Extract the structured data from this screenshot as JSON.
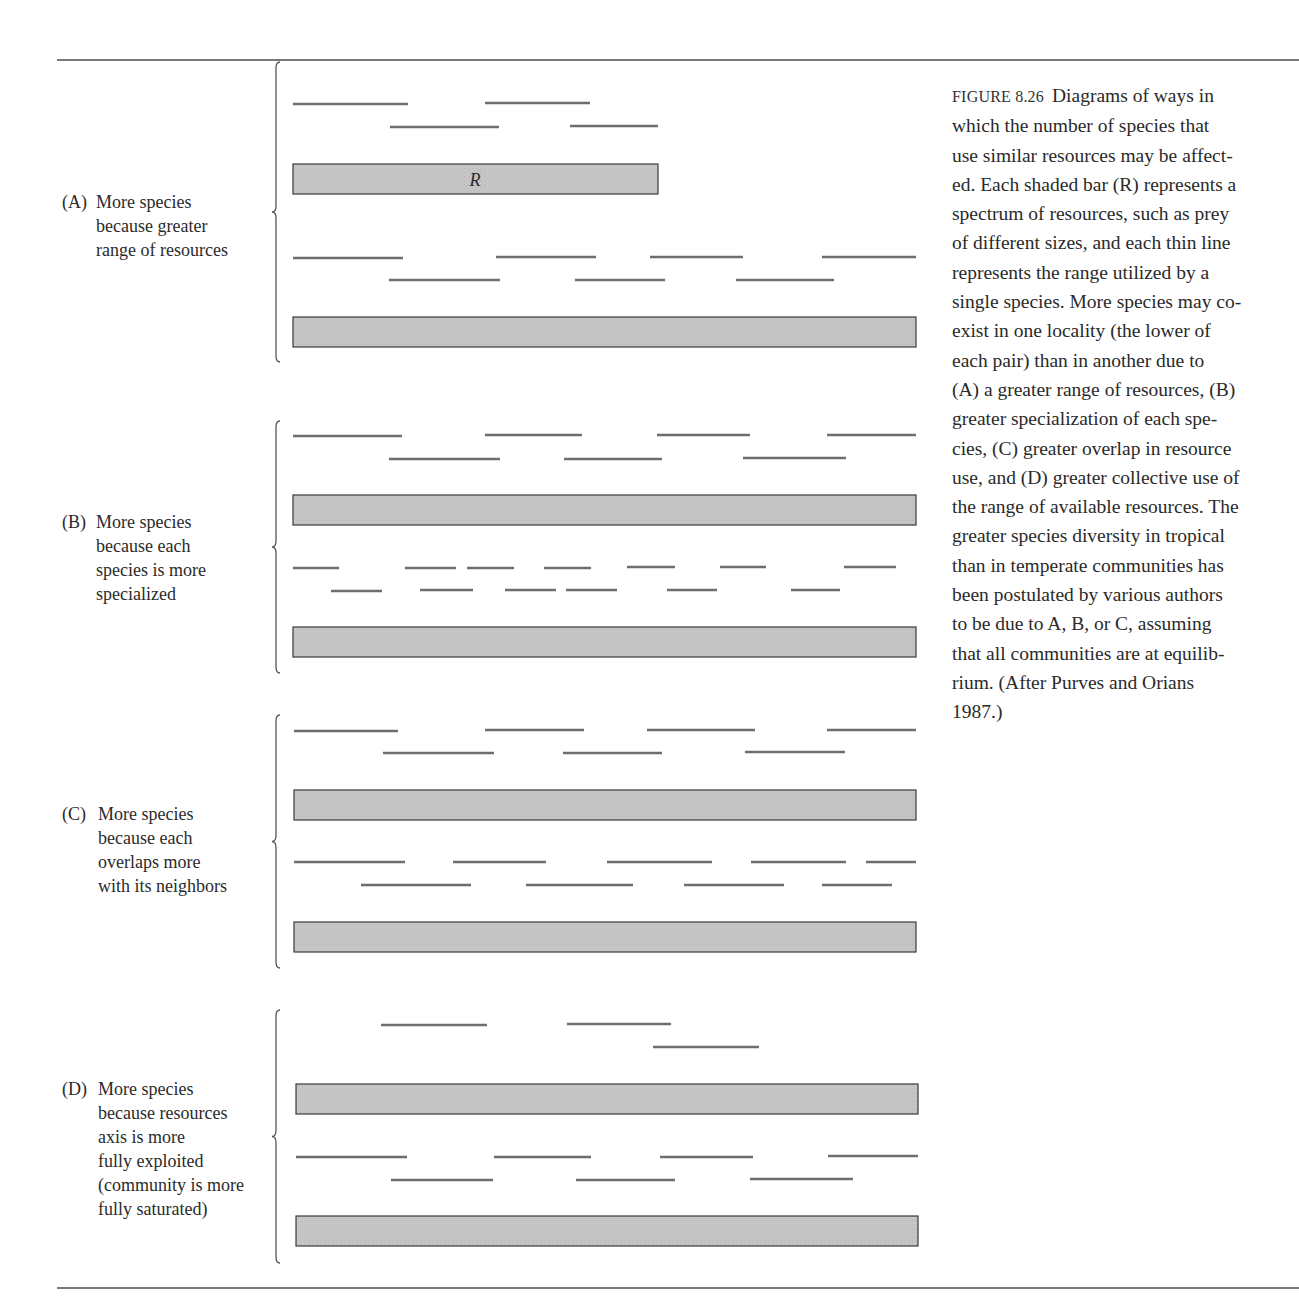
{
  "figure": {
    "number": "FIGURE 8.26",
    "caption_lines": [
      "Diagrams of ways in",
      "which the number of species that",
      "use similar resources may be affect-",
      "ed. Each shaded bar (R) represents a",
      "spectrum of resources, such as prey",
      "of different sizes, and each thin line",
      "represents the range utilized by a",
      "single species. More species may co-",
      "exist in one locality (the lower of",
      "each pair) than in another due to",
      "(A) a greater range of resources, (B)",
      "greater specialization of each spe-",
      "cies, (C) greater overlap in resource",
      "use, and (D) greater collective use of",
      "the range of available resources. The",
      "greater species diversity in tropical",
      "than in temperate communities has",
      "been postulated by various authors",
      "to be due to A, B, or C, assuming",
      "that all communities are at equilib-",
      "rium. (After Purves and Orians",
      "1987.)"
    ]
  },
  "colors": {
    "rule": "#7a7a7a",
    "segment": "#6e6e6e",
    "bar_fill": "#c4c4c4",
    "bar_stroke": "#3a3a3a",
    "text": "#2a2a2a"
  },
  "resource_bar_label": "R",
  "panels": [
    {
      "id": "A",
      "letter": "(A)",
      "label_lines": [
        "More species",
        "because greater",
        "range of resources"
      ],
      "label_top": 190,
      "brace": {
        "x": 276,
        "top": 62,
        "bottom": 362
      },
      "upper": {
        "segments": [
          [
            293,
            104,
            408
          ],
          [
            485,
            103,
            590
          ],
          [
            390,
            127,
            499
          ],
          [
            570,
            126,
            658
          ]
        ],
        "bar": {
          "x1": 293,
          "x2": 658,
          "y": 164,
          "h": 30
        }
      },
      "lower": {
        "segments": [
          [
            293,
            258,
            403
          ],
          [
            496,
            257,
            596
          ],
          [
            650,
            257,
            743
          ],
          [
            822,
            257,
            916
          ],
          [
            389,
            280,
            500
          ],
          [
            575,
            280,
            665
          ],
          [
            736,
            280,
            834
          ]
        ],
        "bar": {
          "x1": 293,
          "x2": 916,
          "y": 317,
          "h": 30
        }
      }
    },
    {
      "id": "B",
      "letter": "(B)",
      "label_lines": [
        "More species",
        "because each",
        "species is more",
        "specialized"
      ],
      "label_top": 510,
      "brace": {
        "x": 276,
        "top": 421,
        "bottom": 673
      },
      "upper": {
        "segments": [
          [
            293,
            436,
            402
          ],
          [
            485,
            435,
            582
          ],
          [
            657,
            435,
            750
          ],
          [
            827,
            435,
            916
          ],
          [
            389,
            459,
            500
          ],
          [
            564,
            459,
            662
          ],
          [
            743,
            458,
            846
          ]
        ],
        "bar": {
          "x1": 293,
          "x2": 916,
          "y": 495,
          "h": 30
        }
      },
      "lower": {
        "segments": [
          [
            293,
            568,
            339
          ],
          [
            405,
            568,
            456
          ],
          [
            467,
            568,
            514
          ],
          [
            544,
            568,
            591
          ],
          [
            627,
            567,
            675
          ],
          [
            720,
            567,
            766
          ],
          [
            844,
            567,
            896
          ],
          [
            331,
            591,
            382
          ],
          [
            420,
            590,
            473
          ],
          [
            505,
            590,
            556
          ],
          [
            566,
            590,
            617
          ],
          [
            667,
            590,
            717
          ],
          [
            791,
            590,
            840
          ]
        ],
        "bar": {
          "x1": 293,
          "x2": 916,
          "y": 627,
          "h": 30
        }
      }
    },
    {
      "id": "C",
      "letter": "(C)",
      "label_lines": [
        "More species",
        "because each",
        "overlaps more",
        "with its neighbors"
      ],
      "label_top": 802,
      "brace": {
        "x": 276,
        "top": 715,
        "bottom": 968
      },
      "upper": {
        "segments": [
          [
            294,
            731,
            398
          ],
          [
            485,
            730,
            584
          ],
          [
            647,
            730,
            755
          ],
          [
            827,
            730,
            916
          ],
          [
            383,
            753,
            494
          ],
          [
            563,
            753,
            662
          ],
          [
            745,
            752,
            845
          ]
        ],
        "bar": {
          "x1": 294,
          "x2": 916,
          "y": 790,
          "h": 30
        }
      },
      "lower": {
        "segments": [
          [
            294,
            862,
            405
          ],
          [
            453,
            862,
            546
          ],
          [
            607,
            862,
            712
          ],
          [
            751,
            862,
            846
          ],
          [
            866,
            862,
            916
          ],
          [
            361,
            885,
            471
          ],
          [
            526,
            885,
            633
          ],
          [
            684,
            885,
            784
          ],
          [
            822,
            885,
            892
          ]
        ],
        "bar": {
          "x1": 294,
          "x2": 916,
          "y": 922,
          "h": 30
        }
      }
    },
    {
      "id": "D",
      "letter": "(D)",
      "label_lines": [
        "More species",
        "because resources",
        "axis is more",
        "fully exploited",
        "(community is more",
        "fully saturated)"
      ],
      "label_top": 1077,
      "brace": {
        "x": 276,
        "top": 1010,
        "bottom": 1263
      },
      "upper": {
        "segments": [
          [
            381,
            1025,
            487
          ],
          [
            567,
            1024,
            671
          ],
          [
            653,
            1047,
            759
          ]
        ],
        "bar": {
          "x1": 296,
          "x2": 918,
          "y": 1084,
          "h": 30
        }
      },
      "lower": {
        "segments": [
          [
            296,
            1157,
            407
          ],
          [
            494,
            1157,
            591
          ],
          [
            660,
            1157,
            753
          ],
          [
            828,
            1156,
            918
          ],
          [
            391,
            1180,
            493
          ],
          [
            576,
            1180,
            675
          ],
          [
            750,
            1179,
            853
          ]
        ],
        "bar": {
          "x1": 296,
          "x2": 918,
          "y": 1216,
          "h": 30
        }
      }
    }
  ]
}
